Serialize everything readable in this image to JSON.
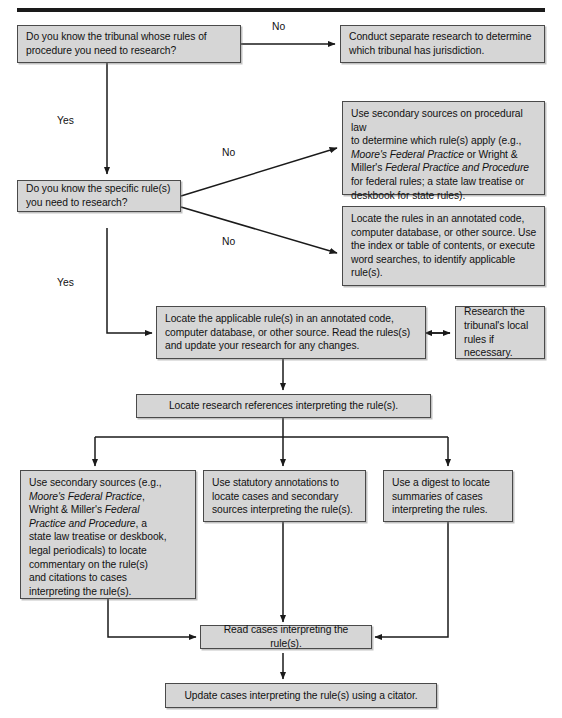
{
  "diagram": {
    "title_rule_present": true,
    "colors": {
      "node_fill": "#d6d6d6",
      "node_border": "#4a4a4a",
      "edge": "#1a1a1a",
      "text": "#111111",
      "background": "#ffffff"
    },
    "nodes": {
      "q_tribunal": "Do you know the tribunal whose rules of procedure you need to research?",
      "conduct_research": "Conduct separate research to determine which tribunal has jurisdiction.",
      "q_specific_rules": "Do you know the specific rule(s) you need to research?",
      "secondary_sources_procedural": {
        "line1": "Use secondary sources on procedural law",
        "line2": "to determine which rule(s) apply (e.g.,",
        "line3_italic": "Moore's Federal Practice",
        "line3_rest": " or Wright &",
        "line4_pre": "Miller's ",
        "line4_italic": "Federal Practice and Procedure",
        "line5": "for federal rules; a state law treatise or",
        "line6": "deskbook for state rules)."
      },
      "locate_rules_annotated": "Locate the rules in an annotated code, computer database, or other source. Use the index or table of contents, or execute word searches, to identify applicable rule(s).",
      "locate_applicable_rule": "Locate the applicable rule(s) in an annotated code, computer database, or other source. Read the rules(s) and update your research for any changes.",
      "research_local_rules": "Research the tribunal's local rules if necessary.",
      "locate_references": "Locate research references interpreting the rule(s).",
      "use_secondary_sources": {
        "line1": "Use secondary sources (e.g.,",
        "line2_italic": "Moore's Federal Practice",
        "line2_rest": ",",
        "line3_pre": "Wright & Miller's ",
        "line3_italic": "Federal",
        "line4_italic": "Practice and Procedure",
        "line4_rest": ", a",
        "line5": "state law treatise or deskbook,",
        "line6": "legal periodicals) to locate",
        "line7": "commentary on the rule(s)",
        "line8": "and citations to cases",
        "line9": "interpreting the rule(s)."
      },
      "use_statutory_annotations": "Use statutory annotations to locate cases and secondary sources interpreting the rule(s).",
      "use_digest": "Use a digest to locate summaries of cases interpreting the rules.",
      "read_cases": "Read cases interpreting the rule(s).",
      "update_cases": "Update cases interpreting the rule(s) using a citator."
    },
    "edge_labels": {
      "no_top": "No",
      "yes_top": "Yes",
      "no_mid_upper": "No",
      "no_mid_lower": "No",
      "yes_mid": "Yes"
    }
  }
}
